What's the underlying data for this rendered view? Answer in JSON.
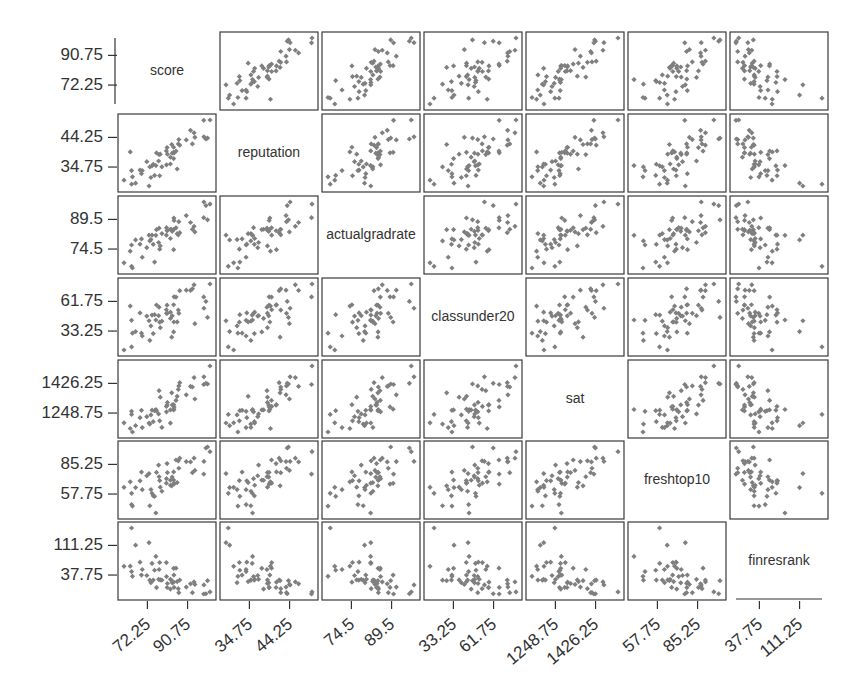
{
  "chart_data": {
    "type": "scatter",
    "subtype": "scatterplot-matrix",
    "title": "",
    "variables": [
      "score",
      "reputation",
      "actualgradrate",
      "classunder20",
      "sat",
      "freshtop10",
      "finresrank"
    ],
    "ticks": {
      "score": [
        "72.25",
        "90.75"
      ],
      "reputation": [
        "34.75",
        "44.25"
      ],
      "actualgradrate": [
        "74.5",
        "89.5"
      ],
      "classunder20": [
        "33.25",
        "61.75"
      ],
      "sat": [
        "1248.75",
        "1426.25"
      ],
      "freshtop10": [
        "57.75",
        "85.25"
      ],
      "finresrank": [
        "37.75",
        "111.25"
      ]
    },
    "y_tick_labels_left": [
      [
        "90.75",
        "72.25"
      ],
      [
        "44.25",
        "34.75"
      ],
      [
        "89.5",
        "74.5"
      ],
      [
        "61.75",
        "33.25"
      ],
      [
        "1426.25",
        "1248.75"
      ],
      [
        "85.25",
        "57.75"
      ],
      [
        "111.25",
        "37.75"
      ]
    ],
    "x_tick_labels_bottom": [
      [
        "72.25",
        "90.75"
      ],
      [
        "34.75",
        "44.25"
      ],
      [
        "74.5",
        "89.5"
      ],
      [
        "33.25",
        "61.75"
      ],
      [
        "1248.75",
        "1426.25"
      ],
      [
        "57.75",
        "85.25"
      ],
      [
        "37.75",
        "111.25"
      ]
    ],
    "correlation_pattern": {
      "score": {
        "reputation": "strong positive",
        "actualgradrate": "strong positive",
        "classunder20": "positive",
        "sat": "strong positive",
        "freshtop10": "positive",
        "finresrank": "negative"
      },
      "reputation": {
        "actualgradrate": "positive",
        "classunder20": "weak positive",
        "sat": "positive",
        "freshtop10": "positive",
        "finresrank": "negative"
      },
      "actualgradrate": {
        "classunder20": "positive",
        "sat": "positive",
        "freshtop10": "positive",
        "finresrank": "negative"
      },
      "classunder20": {
        "sat": "positive",
        "freshtop10": "positive",
        "finresrank": "negative"
      },
      "sat": {
        "freshtop10": "strong positive",
        "finresrank": "negative"
      },
      "freshtop10": {
        "finresrank": "negative"
      }
    },
    "n_points_per_panel_approx": 50,
    "marker": "diamond",
    "marker_color": "#7f7f7f",
    "grid": false,
    "legend": null
  },
  "layout": {
    "col_x": [
      118,
      220,
      322,
      424,
      526,
      628,
      730
    ],
    "row_y": [
      32,
      114,
      196,
      278,
      360,
      441,
      522
    ],
    "panel_w": 98,
    "panel_h": 78
  }
}
